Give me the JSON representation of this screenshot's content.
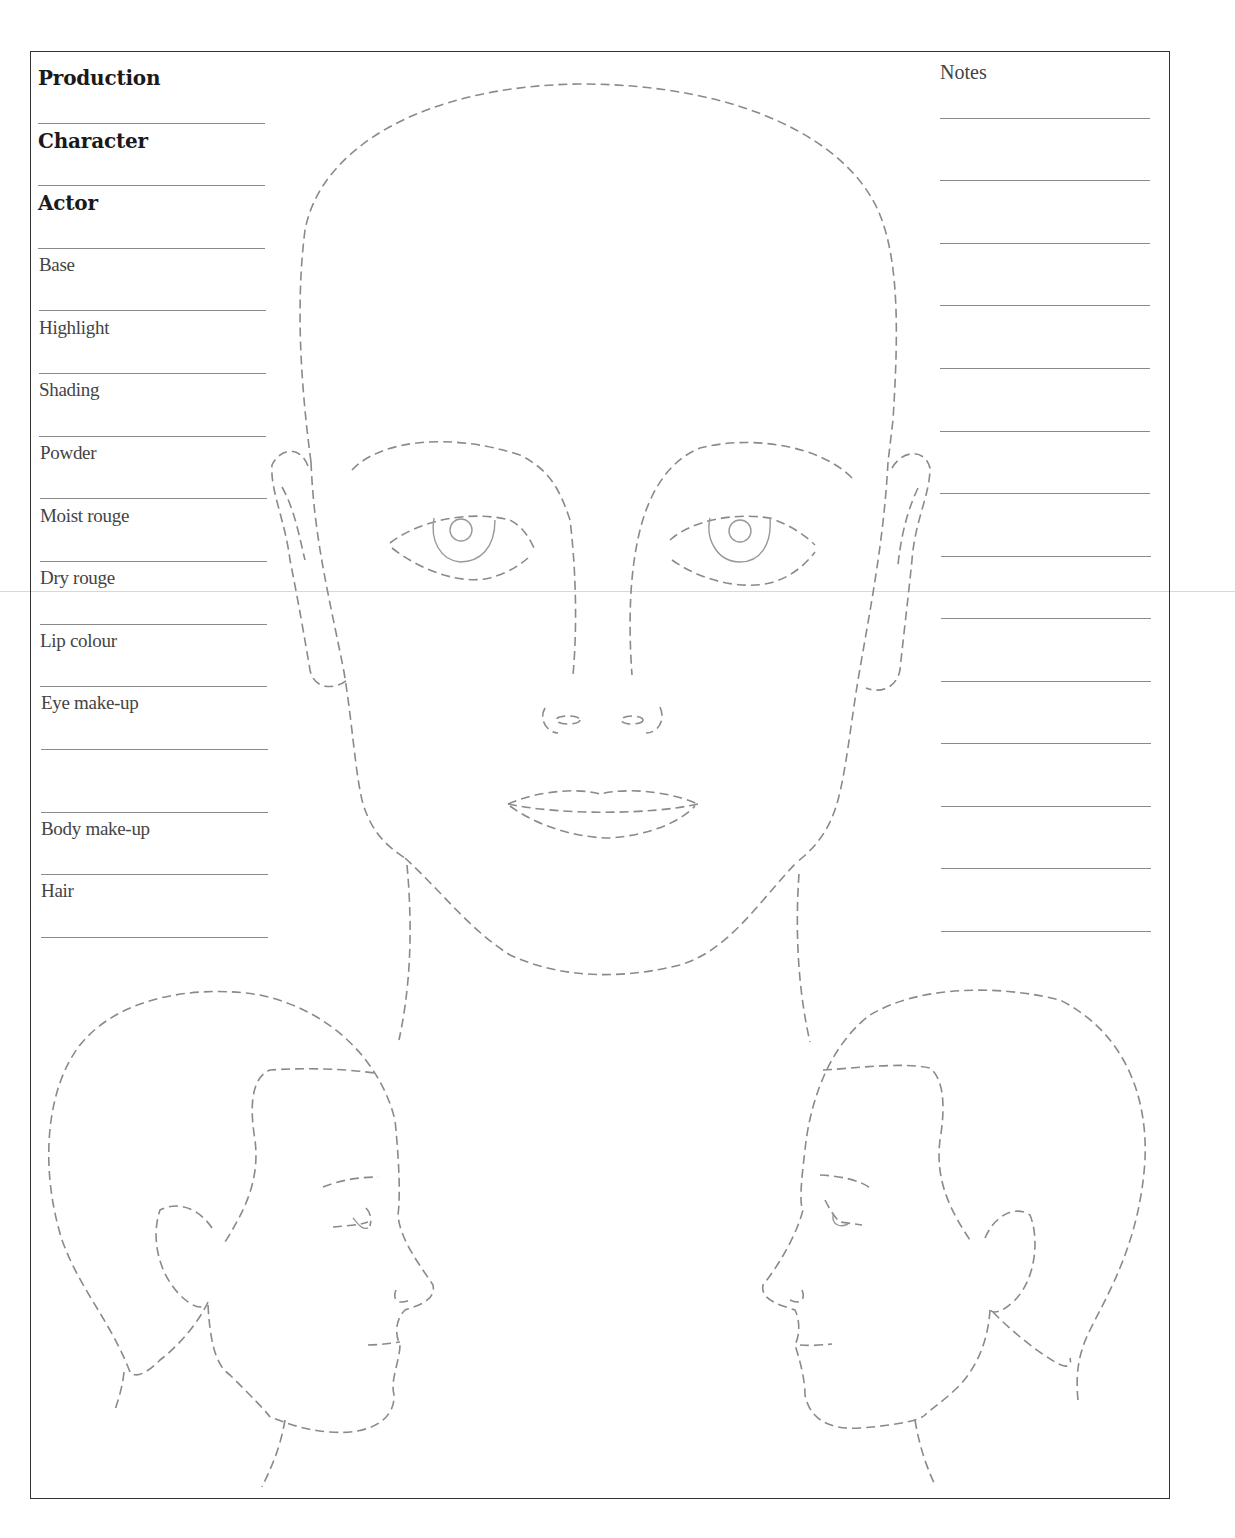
{
  "form": {
    "header_fields": [
      {
        "label": "Production",
        "bold": true
      },
      {
        "label": "Character",
        "bold": true
      },
      {
        "label": "Actor",
        "bold": true
      }
    ],
    "makeup_fields": [
      {
        "label": "Base"
      },
      {
        "label": "Highlight"
      },
      {
        "label": "Shading"
      },
      {
        "label": "Powder"
      },
      {
        "label": "Moist rouge"
      },
      {
        "label": "Dry rouge"
      },
      {
        "label": "Lip colour"
      },
      {
        "label": "Eye make-up"
      },
      {
        "label": "Body make-up"
      },
      {
        "label": "Hair"
      }
    ],
    "notes": {
      "title": "Notes",
      "line_count": 14
    }
  },
  "diagrams": {
    "front_face": "front-view-face-outline",
    "left_profile": "left-facing-profile-outline",
    "right_profile": "right-facing-profile-outline"
  },
  "colors": {
    "border": "#333333",
    "outline": "#8a8a8a",
    "rule": "#8a8a8a",
    "background": "#ffffff"
  }
}
